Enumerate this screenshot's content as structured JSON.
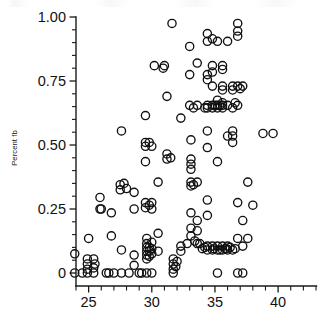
{
  "figure": {
    "background_color": "#ffffff",
    "ink_color": "#111111",
    "width": 336,
    "height": 329
  },
  "chart_data": {
    "type": "scatter",
    "title": "",
    "subtitle": "",
    "xlabel": "",
    "ylabel": "Percent fb",
    "xlim": [
      23.5,
      43.0
    ],
    "ylim": [
      -0.035,
      1.02
    ],
    "grid": false,
    "legend": null,
    "marker": {
      "shape": "open-circle",
      "radius_px": 4.1,
      "stroke": "#111111",
      "fill": "none",
      "stroke_width": 1.35
    },
    "x_major_ticks": [
      25,
      30,
      35,
      40
    ],
    "x_major_tick_labels": [
      "25",
      "30",
      "35",
      "40"
    ],
    "x_minor_tick_step": 1,
    "x_tick_range": [
      24,
      43
    ],
    "y_major_ticks": [
      0,
      0.25,
      0.5,
      0.75,
      1.0
    ],
    "y_major_tick_labels": [
      "0",
      "0.25",
      "0.50",
      "0.75",
      "1.00"
    ],
    "y_minor_tick_step": 0.05,
    "n_points": 168,
    "points": [
      [
        23.9,
        0.075
      ],
      [
        23.9,
        0.0
      ],
      [
        24.9,
        0.055
      ],
      [
        24.9,
        0.035
      ],
      [
        24.9,
        0.015
      ],
      [
        24.9,
        0.0
      ],
      [
        25.0,
        0.135
      ],
      [
        25.4,
        0.055
      ],
      [
        25.4,
        0.02
      ],
      [
        25.4,
        0.0
      ],
      [
        25.9,
        0.295
      ],
      [
        25.9,
        0.25
      ],
      [
        26.4,
        0.0
      ],
      [
        26.8,
        0.235
      ],
      [
        26.8,
        0.145
      ],
      [
        27.0,
        0.0
      ],
      [
        27.5,
        0.345
      ],
      [
        27.5,
        0.325
      ],
      [
        27.6,
        0.555
      ],
      [
        27.6,
        0.09
      ],
      [
        27.6,
        0.0
      ],
      [
        28.2,
        0.0
      ],
      [
        28.6,
        0.315
      ],
      [
        28.6,
        0.25
      ],
      [
        28.6,
        0.07
      ],
      [
        28.6,
        0.03
      ],
      [
        29.0,
        0.0
      ],
      [
        29.5,
        0.615
      ],
      [
        29.5,
        0.51
      ],
      [
        29.5,
        0.495
      ],
      [
        29.5,
        0.435
      ],
      [
        29.5,
        0.275
      ],
      [
        29.5,
        0.255
      ],
      [
        29.6,
        0.135
      ],
      [
        29.6,
        0.115
      ],
      [
        29.6,
        0.1
      ],
      [
        29.6,
        0.085
      ],
      [
        29.6,
        0.07
      ],
      [
        29.6,
        0.055
      ],
      [
        29.6,
        0.0
      ],
      [
        30.0,
        0.25
      ],
      [
        30.2,
        0.81
      ],
      [
        30.5,
        0.355
      ],
      [
        30.5,
        0.155
      ],
      [
        30.5,
        0.085
      ],
      [
        31.0,
        0.81
      ],
      [
        31.2,
        0.69
      ],
      [
        31.2,
        0.465
      ],
      [
        31.2,
        0.445
      ],
      [
        31.6,
        0.975
      ],
      [
        31.7,
        0.055
      ],
      [
        31.7,
        0.035
      ],
      [
        31.7,
        0.015
      ],
      [
        31.7,
        0.0
      ],
      [
        32.3,
        0.605
      ],
      [
        32.3,
        0.105
      ],
      [
        32.3,
        0.085
      ],
      [
        33.0,
        0.885
      ],
      [
        33.0,
        0.775
      ],
      [
        33.0,
        0.655
      ],
      [
        33.1,
        0.52
      ],
      [
        33.1,
        0.445
      ],
      [
        33.1,
        0.425
      ],
      [
        33.1,
        0.405
      ],
      [
        33.1,
        0.355
      ],
      [
        33.1,
        0.34
      ],
      [
        33.1,
        0.235
      ],
      [
        33.1,
        0.175
      ],
      [
        33.1,
        0.145
      ],
      [
        33.6,
        0.82
      ],
      [
        33.6,
        0.655
      ],
      [
        33.6,
        0.355
      ],
      [
        33.6,
        0.205
      ],
      [
        33.6,
        0.165
      ],
      [
        33.6,
        0.115
      ],
      [
        34.4,
        0.935
      ],
      [
        34.4,
        0.905
      ],
      [
        34.4,
        0.775
      ],
      [
        34.4,
        0.755
      ],
      [
        34.4,
        0.655
      ],
      [
        34.4,
        0.645
      ],
      [
        34.4,
        0.555
      ],
      [
        34.4,
        0.49
      ],
      [
        34.4,
        0.285
      ],
      [
        34.4,
        0.225
      ],
      [
        34.4,
        0.105
      ],
      [
        34.4,
        0.09
      ],
      [
        34.8,
        0.915
      ],
      [
        34.8,
        0.81
      ],
      [
        34.8,
        0.785
      ],
      [
        34.8,
        0.73
      ],
      [
        34.8,
        0.655
      ],
      [
        34.8,
        0.645
      ],
      [
        34.8,
        0.105
      ],
      [
        34.8,
        0.09
      ],
      [
        35.2,
        0.905
      ],
      [
        35.2,
        0.675
      ],
      [
        35.2,
        0.655
      ],
      [
        35.2,
        0.645
      ],
      [
        35.2,
        0.435
      ],
      [
        35.2,
        0.105
      ],
      [
        35.2,
        0.09
      ],
      [
        35.2,
        0.0
      ],
      [
        35.6,
        0.81
      ],
      [
        35.6,
        0.795
      ],
      [
        35.6,
        0.73
      ],
      [
        35.6,
        0.715
      ],
      [
        35.6,
        0.665
      ],
      [
        35.6,
        0.655
      ],
      [
        35.6,
        0.645
      ],
      [
        35.6,
        0.105
      ],
      [
        35.6,
        0.09
      ],
      [
        36.0,
        0.905
      ],
      [
        36.0,
        0.655
      ],
      [
        36.0,
        0.535
      ],
      [
        36.0,
        0.105
      ],
      [
        36.0,
        0.09
      ],
      [
        36.4,
        0.73
      ],
      [
        36.4,
        0.715
      ],
      [
        36.4,
        0.645
      ],
      [
        36.4,
        0.555
      ],
      [
        36.4,
        0.535
      ],
      [
        36.4,
        0.51
      ],
      [
        36.4,
        0.09
      ],
      [
        36.8,
        0.975
      ],
      [
        36.8,
        0.945
      ],
      [
        36.8,
        0.925
      ],
      [
        36.8,
        0.73
      ],
      [
        36.8,
        0.655
      ],
      [
        36.8,
        0.275
      ],
      [
        36.8,
        0.135
      ],
      [
        36.8,
        0.0
      ],
      [
        37.2,
        0.73
      ],
      [
        37.2,
        0.205
      ],
      [
        37.2,
        0.105
      ],
      [
        37.2,
        0.0
      ],
      [
        37.6,
        0.355
      ],
      [
        37.6,
        0.135
      ],
      [
        38.0,
        0.265
      ],
      [
        38.8,
        0.545
      ],
      [
        39.6,
        0.545
      ],
      [
        30.0,
        0.495
      ],
      [
        30.0,
        0.275
      ],
      [
        30.0,
        0.12
      ],
      [
        30.0,
        0.095
      ],
      [
        30.0,
        0.075
      ],
      [
        30.0,
        0.0
      ],
      [
        26.0,
        0.25
      ],
      [
        25.5,
        0.035
      ],
      [
        24.5,
        0.0
      ],
      [
        32.8,
        0.115
      ],
      [
        33.4,
        0.125
      ],
      [
        34.0,
        0.095
      ],
      [
        34.9,
        0.095
      ],
      [
        35.9,
        0.095
      ],
      [
        36.2,
        0.1
      ],
      [
        29.8,
        0.51
      ],
      [
        29.8,
        0.265
      ],
      [
        29.8,
        0.1
      ],
      [
        29.8,
        0.085
      ],
      [
        29.8,
        0.065
      ],
      [
        31.9,
        0.025
      ],
      [
        33.3,
        0.645
      ],
      [
        33.3,
        0.345
      ],
      [
        35.4,
        0.655
      ],
      [
        35.4,
        0.09
      ],
      [
        36.6,
        0.665
      ],
      [
        36.6,
        0.095
      ],
      [
        34.2,
        0.645
      ],
      [
        34.2,
        0.1
      ],
      [
        37.0,
        0.72
      ],
      [
        30.9,
        0.8
      ],
      [
        28.0,
        0.33
      ],
      [
        27.8,
        0.35
      ],
      [
        35.0,
        0.655
      ],
      [
        35.8,
        0.095
      ],
      [
        33.8,
        0.115
      ],
      [
        32.0,
        0.045
      ],
      [
        31.5,
        0.45
      ],
      [
        29.2,
        0.0
      ],
      [
        26.6,
        0.0
      ]
    ]
  }
}
